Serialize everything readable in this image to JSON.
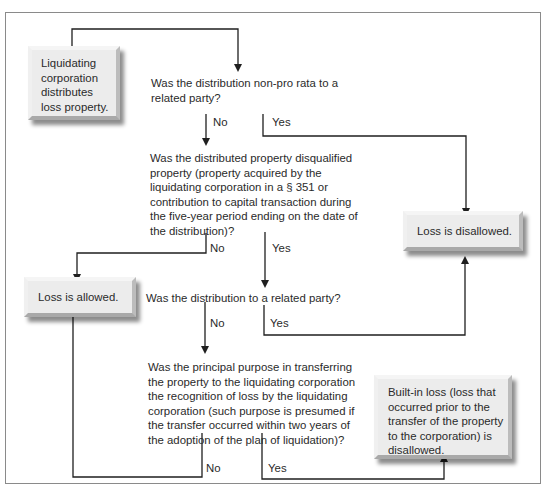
{
  "diagram": {
    "type": "flowchart",
    "start": {
      "text_lines": [
        "Liquidating",
        "corporation",
        "distributes",
        "loss property."
      ]
    },
    "questions": [
      {
        "id": "q1",
        "lines": [
          "Was the distribution non-pro rata to a",
          "related party?"
        ]
      },
      {
        "id": "q2",
        "lines": [
          "Was the distributed property disqualified",
          "property (property acquired by the",
          "liquidating corporation in a § 351 or",
          "contribution to capital transaction during",
          "the five-year period ending on the date of",
          "the distribution)?"
        ]
      },
      {
        "id": "q3",
        "lines": [
          "Was the distribution to a related party?"
        ]
      },
      {
        "id": "q4",
        "lines": [
          "Was the principal purpose in transferring",
          "the property to the liquidating corporation",
          "the recognition of loss by the liquidating",
          "corporation (such purpose is presumed if",
          "the transfer occurred within two years of",
          "the adoption of the plan of liquidation)?"
        ]
      }
    ],
    "outcomes": {
      "disallowed": "Loss is disallowed.",
      "allowed": "Loss is allowed.",
      "builtin": [
        "Built-in loss (loss that",
        "occurred prior to the",
        "transfer of the property",
        "to the corporation) is",
        "disallowed."
      ]
    },
    "branch_labels": {
      "no": "No",
      "yes": "Yes"
    },
    "edges": [
      {
        "from": "start",
        "to": "q1"
      },
      {
        "from": "q1",
        "label": "No",
        "to": "q2"
      },
      {
        "from": "q1",
        "label": "Yes",
        "to": "disallowed"
      },
      {
        "from": "q2",
        "label": "No",
        "to": "allowed"
      },
      {
        "from": "q2",
        "label": "Yes",
        "to": "q3"
      },
      {
        "from": "q3",
        "label": "No",
        "to": "q4"
      },
      {
        "from": "q3",
        "label": "Yes",
        "to": "disallowed"
      },
      {
        "from": "q4",
        "label": "No",
        "to": "allowed"
      },
      {
        "from": "q4",
        "label": "Yes",
        "to": "builtin"
      }
    ],
    "colors": {
      "line": "#1f1f1f",
      "box_fill": "#ececec",
      "frame": "#8a8a8a"
    }
  }
}
